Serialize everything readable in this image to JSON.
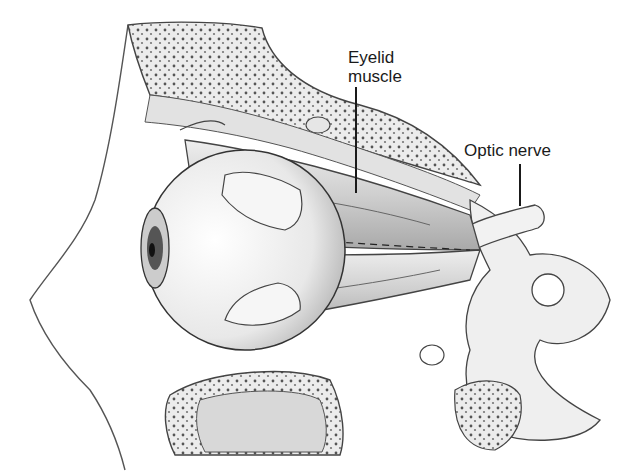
{
  "figure": {
    "labels": [
      {
        "id": "eyelid-muscle",
        "text_line1": "Eyelid",
        "text_line2": "muscle"
      },
      {
        "id": "optic-nerve",
        "text": "Optic nerve"
      }
    ]
  },
  "colors": {
    "ink": "#1a1a1a",
    "bone_fill": "#e6e6e6",
    "muscle_fill": "#d4d4d4",
    "eyeball_fill": "#f4f4f4",
    "background": "#ffffff"
  }
}
